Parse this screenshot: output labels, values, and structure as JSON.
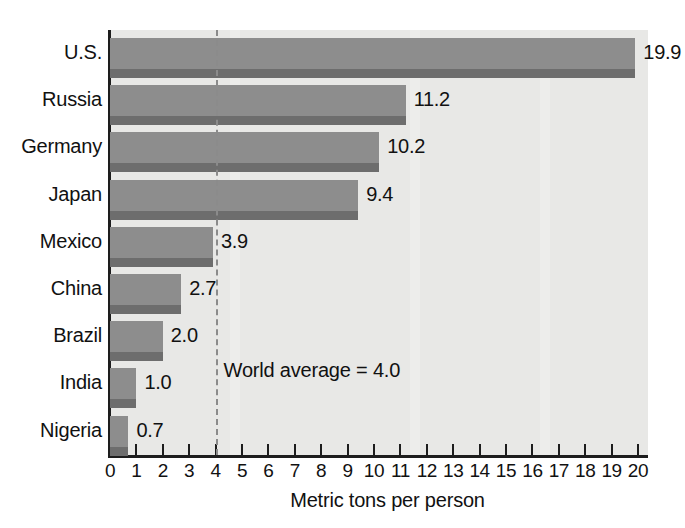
{
  "chart_data": {
    "type": "bar",
    "orientation": "horizontal",
    "title": "",
    "xlabel": "Metric tons per person",
    "ylabel": "",
    "xlim": [
      0,
      20
    ],
    "grid": false,
    "legend": "none",
    "categories": [
      "U.S.",
      "Russia",
      "Germany",
      "Japan",
      "Mexico",
      "China",
      "Brazil",
      "India",
      "Nigeria"
    ],
    "values": [
      19.9,
      11.2,
      10.2,
      9.4,
      3.9,
      2.7,
      2.0,
      1.0,
      0.7
    ],
    "value_labels": [
      "19.9",
      "11.2",
      "10.2",
      "9.4",
      "3.9",
      "2.7",
      "2.0",
      "1.0",
      "0.7"
    ],
    "xticks": [
      0,
      1,
      2,
      3,
      4,
      5,
      6,
      7,
      8,
      9,
      10,
      11,
      12,
      13,
      14,
      15,
      16,
      17,
      18,
      19,
      20
    ],
    "xtick_labels": [
      "0",
      "1",
      "2",
      "3",
      "4",
      "5",
      "6",
      "7",
      "8",
      "9",
      "10",
      "11",
      "12",
      "13",
      "14",
      "15",
      "16",
      "17",
      "18",
      "19",
      "20"
    ],
    "annotations": [
      {
        "name": "world-average",
        "text": "World average = 4.0",
        "value": 4.0,
        "style": "dashed-vertical-line"
      }
    ],
    "colors": {
      "bar_face": "#8d8d8d",
      "bar_shadow": "#6d6d6d",
      "plot_background": "#e8e8e6",
      "axis": "#1d1d1d",
      "text": "#111111",
      "average_line": "#8b8b8b"
    }
  },
  "axis": {
    "x_title": "Metric tons per person"
  },
  "average": {
    "label": "World average = 4.0"
  }
}
